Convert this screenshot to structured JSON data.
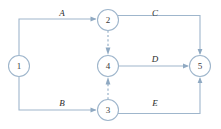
{
  "diagram": {
    "type": "activity-on-arrow-network",
    "colors": {
      "line": "#9fb6cc",
      "dummy_line": "#a9bed2",
      "arrow": "#8fa9c2",
      "node_fill": "#ffffff",
      "node_stroke": "#9fb6cc",
      "label_text": "#2b2b2b",
      "node_text": "#3a3a3a",
      "background": "#ffffff"
    },
    "nodes": [
      {
        "id": "n1",
        "label": "1",
        "cx": 19,
        "cy": 66,
        "r": 10.5
      },
      {
        "id": "n2",
        "label": "2",
        "cx": 108,
        "cy": 20,
        "r": 10.5
      },
      {
        "id": "n4",
        "label": "4",
        "cx": 108,
        "cy": 66,
        "r": 10.5
      },
      {
        "id": "n3",
        "label": "3",
        "cx": 108,
        "cy": 110,
        "r": 10.5
      },
      {
        "id": "n5",
        "label": "5",
        "cx": 200,
        "cy": 66,
        "r": 10.5
      }
    ],
    "edges": [
      {
        "id": "eA",
        "label": "A",
        "from": "n1",
        "to": "n2",
        "style": "solid",
        "label_x": 62,
        "label_y": 13
      },
      {
        "id": "eC",
        "label": "C",
        "from": "n2",
        "to": "n5",
        "style": "solid",
        "label_x": 155,
        "label_y": 13
      },
      {
        "id": "eD",
        "label": "D",
        "from": "n4",
        "to": "n5",
        "style": "solid",
        "label_x": 155,
        "label_y": 59
      },
      {
        "id": "eB",
        "label": "B",
        "from": "n1",
        "to": "n3",
        "style": "solid",
        "label_x": 62,
        "label_y": 103
      },
      {
        "id": "eE",
        "label": "E",
        "from": "n3",
        "to": "n5",
        "style": "solid",
        "label_x": 155,
        "label_y": 103
      },
      {
        "id": "dummy24",
        "label": "",
        "from": "n2",
        "to": "n4",
        "style": "dashed",
        "label_x": 0,
        "label_y": 0
      },
      {
        "id": "dummy34",
        "label": "",
        "from": "n3",
        "to": "n4",
        "style": "dashed",
        "label_x": 0,
        "label_y": 0
      }
    ]
  }
}
